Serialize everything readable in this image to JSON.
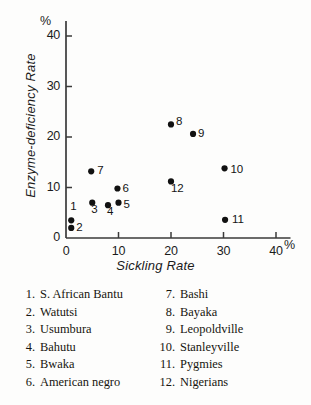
{
  "chart_data": {
    "type": "scatter",
    "title": "",
    "xlabel": "Sickling  Rate",
    "ylabel": "Enzyme-deficiency Rate",
    "x_unit": "%",
    "y_unit": "%",
    "xlim": [
      0,
      42
    ],
    "ylim": [
      0,
      42
    ],
    "xticks": [
      0,
      10,
      20,
      30,
      40
    ],
    "xtick_labels": [
      "0",
      "10",
      "20",
      "30",
      "40"
    ],
    "yticks": [
      0,
      10,
      20,
      30,
      40
    ],
    "ytick_labels": [
      "0",
      "10",
      "20",
      "30",
      "40"
    ],
    "grid": false,
    "legend_position": "below-plot",
    "point_label_position": "right-of-marker",
    "marker": "filled-circle",
    "marker_color": "#111111",
    "axis_color": "#3a3a3a",
    "points": [
      {
        "id": "1",
        "label": "1",
        "name": "S. African Bantu",
        "x": 1.0,
        "y": 3.5,
        "label_dx": -1,
        "label_dy": -13
      },
      {
        "id": "2",
        "label": "2",
        "name": "Watutsi",
        "x": 1.0,
        "y": 2.0,
        "label_dx": 5,
        "label_dy": 0
      },
      {
        "id": "3",
        "label": "3",
        "name": "Usumbura",
        "x": 5.0,
        "y": 7.0,
        "label_dx": -1,
        "label_dy": 7
      },
      {
        "id": "4",
        "label": "4",
        "name": "Bahutu",
        "x": 8.0,
        "y": 6.5,
        "label_dx": -1,
        "label_dy": 7
      },
      {
        "id": "5",
        "label": "5",
        "name": "Bwaka",
        "x": 10.0,
        "y": 7.0,
        "label_dx": 5,
        "label_dy": 2
      },
      {
        "id": "6",
        "label": "6",
        "name": "American negro",
        "x": 9.8,
        "y": 9.8,
        "label_dx": 5,
        "label_dy": 0
      },
      {
        "id": "7",
        "label": "7",
        "name": "Bashi",
        "x": 4.8,
        "y": 13.2,
        "label_dx": 6,
        "label_dy": 0
      },
      {
        "id": "8",
        "label": "8",
        "name": "Bayaka",
        "x": 20.0,
        "y": 22.5,
        "label_dx": 5,
        "label_dy": -2
      },
      {
        "id": "9",
        "label": "9",
        "name": "Leopoldville",
        "x": 24.2,
        "y": 20.6,
        "label_dx": 5,
        "label_dy": 0
      },
      {
        "id": "10",
        "label": "10",
        "name": "Stanleyville",
        "x": 30.2,
        "y": 13.8,
        "label_dx": 6,
        "label_dy": 2
      },
      {
        "id": "11",
        "label": "11",
        "name": "Pygmies",
        "x": 30.3,
        "y": 3.6,
        "label_dx": 7,
        "label_dy": 0
      },
      {
        "id": "12",
        "label": "12",
        "name": "Nigerians",
        "x": 20.0,
        "y": 11.2,
        "label_dx": 0,
        "label_dy": 8
      }
    ]
  },
  "legend": {
    "left_column": [
      {
        "num": "1.",
        "name": "S. African Bantu"
      },
      {
        "num": "2.",
        "name": "Watutsi"
      },
      {
        "num": "3.",
        "name": "Usumbura"
      },
      {
        "num": "4.",
        "name": "Bahutu"
      },
      {
        "num": "5.",
        "name": "Bwaka"
      },
      {
        "num": "6.",
        "name": "American negro"
      }
    ],
    "right_column": [
      {
        "num": "7.",
        "name": "Bashi"
      },
      {
        "num": "8.",
        "name": "Bayaka"
      },
      {
        "num": "9.",
        "name": "Leopoldville"
      },
      {
        "num": "10.",
        "name": "Stanleyville"
      },
      {
        "num": "11.",
        "name": "Pygmies"
      },
      {
        "num": "12.",
        "name": "Nigerians"
      }
    ]
  }
}
